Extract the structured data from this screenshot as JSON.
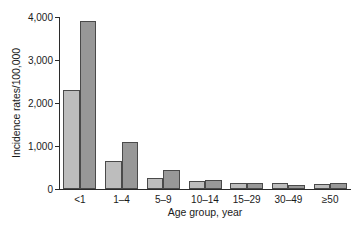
{
  "chart_data": {
    "type": "bar",
    "title": "",
    "xlabel": "Age group, year",
    "ylabel": "Incidence rates/100,000",
    "categories": [
      "<1",
      "1–4",
      "5–9",
      "10–14",
      "15–29",
      "30–49",
      "≥50"
    ],
    "series": [
      {
        "name": "series-1",
        "color": "#bdbdbd",
        "values": [
          2300,
          650,
          260,
          190,
          150,
          150,
          120
        ]
      },
      {
        "name": "series-2",
        "color": "#989898",
        "values": [
          3900,
          1100,
          450,
          215,
          130,
          105,
          150
        ]
      }
    ],
    "ylim": [
      0,
      4000
    ],
    "yticks": [
      0,
      1000,
      2000,
      3000,
      4000
    ],
    "ytick_labels": [
      "0",
      "1,000",
      "2,000",
      "3,000",
      "4,000"
    ],
    "grid": false,
    "legend": "none"
  }
}
